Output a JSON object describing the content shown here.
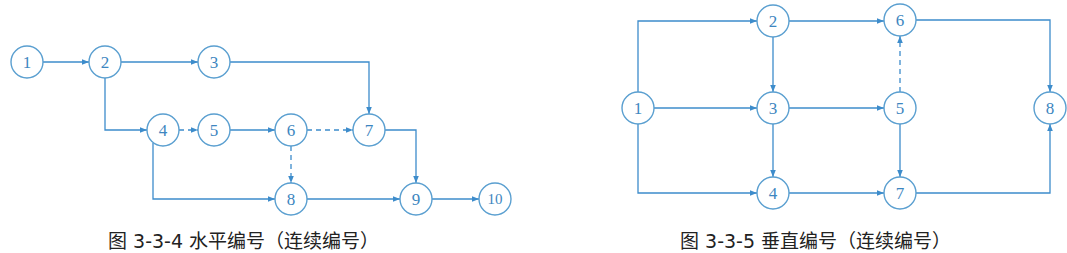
{
  "figures": [
    {
      "id": "left",
      "caption": "图 3-3-4  水平编号（连续编号）",
      "nodes": [
        {
          "label": "1",
          "x": 27,
          "y": 62
        },
        {
          "label": "2",
          "x": 105,
          "y": 62
        },
        {
          "label": "3",
          "x": 214,
          "y": 62
        },
        {
          "label": "4",
          "x": 163,
          "y": 130
        },
        {
          "label": "5",
          "x": 214,
          "y": 130
        },
        {
          "label": "6",
          "x": 291,
          "y": 130
        },
        {
          "label": "7",
          "x": 369,
          "y": 130
        },
        {
          "label": "8",
          "x": 291,
          "y": 199
        },
        {
          "label": "9",
          "x": 416,
          "y": 199
        },
        {
          "label": "10",
          "x": 495,
          "y": 199
        }
      ],
      "edges": [
        {
          "from": "1",
          "to": "2",
          "type": "solid"
        },
        {
          "from": "2",
          "to": "3",
          "type": "solid"
        },
        {
          "from": "2",
          "to": "4",
          "type": "solid"
        },
        {
          "from": "3",
          "to": "7",
          "type": "solid"
        },
        {
          "from": "4",
          "to": "5",
          "type": "dashed"
        },
        {
          "from": "4",
          "to": "8",
          "type": "solid"
        },
        {
          "from": "5",
          "to": "6",
          "type": "solid"
        },
        {
          "from": "6",
          "to": "7",
          "type": "dashed"
        },
        {
          "from": "6",
          "to": "8",
          "type": "dashed"
        },
        {
          "from": "7",
          "to": "9",
          "type": "solid"
        },
        {
          "from": "8",
          "to": "9",
          "type": "solid"
        },
        {
          "from": "9",
          "to": "10",
          "type": "solid"
        }
      ]
    },
    {
      "id": "right",
      "caption": "图 3-3-5  垂直编号（连续编号）",
      "nodes": [
        {
          "label": "1",
          "x": 638,
          "y": 108
        },
        {
          "label": "2",
          "x": 773,
          "y": 21
        },
        {
          "label": "3",
          "x": 773,
          "y": 108
        },
        {
          "label": "4",
          "x": 773,
          "y": 193
        },
        {
          "label": "5",
          "x": 900,
          "y": 108
        },
        {
          "label": "6",
          "x": 900,
          "y": 20
        },
        {
          "label": "7",
          "x": 900,
          "y": 193
        },
        {
          "label": "8",
          "x": 1050,
          "y": 108
        }
      ],
      "edges": [
        {
          "from": "1",
          "to": "2",
          "type": "solid"
        },
        {
          "from": "1",
          "to": "3",
          "type": "solid"
        },
        {
          "from": "1",
          "to": "4",
          "type": "solid"
        },
        {
          "from": "2",
          "to": "3",
          "type": "solid"
        },
        {
          "from": "2",
          "to": "6",
          "type": "solid"
        },
        {
          "from": "3",
          "to": "4",
          "type": "solid"
        },
        {
          "from": "3",
          "to": "5",
          "type": "solid"
        },
        {
          "from": "4",
          "to": "7",
          "type": "solid"
        },
        {
          "from": "5",
          "to": "6",
          "type": "dashed"
        },
        {
          "from": "5",
          "to": "7",
          "type": "solid"
        },
        {
          "from": "6",
          "to": "8",
          "type": "solid"
        },
        {
          "from": "7",
          "to": "8",
          "type": "solid"
        }
      ]
    }
  ],
  "colors": {
    "line": "#3d8ccb",
    "node_stroke": "#5a9fd0",
    "node_text": "#3d86c0"
  }
}
